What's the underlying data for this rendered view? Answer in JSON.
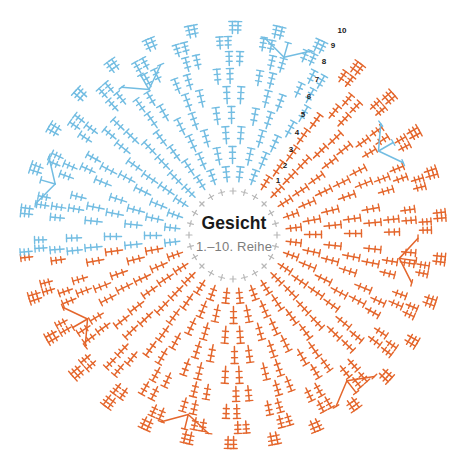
{
  "document": {
    "kind": "crochet-chart",
    "background_color": "#ffffff",
    "width": 468,
    "height": 475
  },
  "center": {
    "title": "Gesicht",
    "subtitle": "1.–10. Reihe",
    "title_color": "#1a1a1a",
    "subtitle_color": "#7d7d7d"
  },
  "palette": {
    "blue": "#73bde2",
    "blue_light": "#a8d7ee",
    "orange": "#e4662c",
    "orange_light": "#ef9d74",
    "gray": "#b8b8b8",
    "text_dark": "#1a1a1a",
    "text_gray": "#7d7d7d"
  },
  "geometry": {
    "cx": 233,
    "cy": 235,
    "inner_radius": 36,
    "outer_radius": 215,
    "rounds": 10,
    "spokes": 48
  },
  "legend_rounds": {
    "label_prefix": "",
    "numbers": [
      "1",
      "2",
      "3",
      "4",
      "5",
      "6",
      "7",
      "8",
      "9",
      "10"
    ]
  },
  "row_markers": [
    {
      "label": "1",
      "x": 278,
      "y": 181
    },
    {
      "label": "2",
      "x": 285,
      "y": 166
    },
    {
      "label": "3",
      "x": 291,
      "y": 150
    },
    {
      "label": "4",
      "x": 297,
      "y": 133
    },
    {
      "label": "5",
      "x": 303,
      "y": 115
    },
    {
      "label": "6",
      "x": 309,
      "y": 97
    },
    {
      "label": "7",
      "x": 317,
      "y": 80
    },
    {
      "label": "8",
      "x": 324,
      "y": 62
    },
    {
      "label": "9",
      "x": 333,
      "y": 46
    },
    {
      "label": "10",
      "x": 342,
      "y": 31
    }
  ],
  "chart_data": {
    "type": "radial-stitch-diagram",
    "title": "Gesicht",
    "subtitle": "1.–10. Reihe",
    "center_x": 233,
    "center_y": 235,
    "inner_radius": 36,
    "outer_radius": 215,
    "round_count": 10,
    "half_colors": {
      "left_half": "#73bde2",
      "right_half": "#e4662c"
    },
    "stitch_symbol": "treble-crochet-bar",
    "inner_ring_symbol": "single-crochet-plus",
    "rounds": [
      {
        "round": 1,
        "r_start": 36,
        "r_end": 52,
        "stitches": 24,
        "symbol": "single-crochet"
      },
      {
        "round": 2,
        "r_start": 52,
        "r_end": 70,
        "stitches": 28,
        "symbol": "treble"
      },
      {
        "round": 3,
        "r_start": 70,
        "r_end": 90,
        "stitches": 32,
        "symbol": "treble"
      },
      {
        "round": 4,
        "r_start": 90,
        "r_end": 110,
        "stitches": 36,
        "symbol": "treble"
      },
      {
        "round": 5,
        "r_start": 110,
        "r_end": 130,
        "stitches": 40,
        "symbol": "treble"
      },
      {
        "round": 6,
        "r_start": 130,
        "r_end": 150,
        "stitches": 44,
        "symbol": "treble"
      },
      {
        "round": 7,
        "r_start": 150,
        "r_end": 168,
        "stitches": 48,
        "symbol": "treble"
      },
      {
        "round": 8,
        "r_start": 168,
        "r_end": 185,
        "stitches": 52,
        "symbol": "treble"
      },
      {
        "round": 9,
        "r_start": 185,
        "r_end": 200,
        "stitches": 56,
        "symbol": "treble"
      },
      {
        "round": 10,
        "r_start": 200,
        "r_end": 215,
        "stitches": 60,
        "symbol": "treble"
      }
    ],
    "increase_clusters": [
      {
        "angle_deg": 8,
        "round": 8,
        "color": "#e4662c"
      },
      {
        "angle_deg": 52,
        "round": 9,
        "color": "#e4662c"
      },
      {
        "angle_deg": 104,
        "round": 9,
        "color": "#e4662c"
      },
      {
        "angle_deg": 150,
        "round": 8,
        "color": "#e4662c"
      },
      {
        "angle_deg": 196,
        "round": 9,
        "color": "#73bde2"
      },
      {
        "angle_deg": 240,
        "round": 8,
        "color": "#73bde2"
      },
      {
        "angle_deg": 286,
        "round": 9,
        "color": "#73bde2"
      },
      {
        "angle_deg": 330,
        "round": 8,
        "color": "#73bde2"
      }
    ]
  }
}
